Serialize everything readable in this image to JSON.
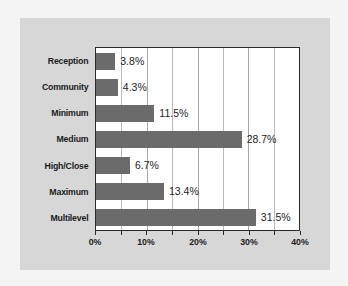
{
  "chart_data": {
    "type": "bar",
    "orientation": "horizontal",
    "title": "",
    "subtitle": "",
    "xlabel": "",
    "ylabel": "",
    "categories": [
      "Reception",
      "Community",
      "Minimum",
      "Medium",
      "High/Close",
      "Maximum",
      "Multilevel"
    ],
    "values": [
      3.8,
      4.3,
      11.5,
      28.7,
      6.7,
      13.4,
      31.5
    ],
    "value_labels": [
      "3.8%",
      "4.3%",
      "11.5%",
      "28.7%",
      "6.7%",
      "13.4%",
      "31.5%"
    ],
    "xlim": [
      0,
      40
    ],
    "xticks": [
      0,
      10,
      20,
      30,
      40
    ],
    "xtick_labels": [
      "0%",
      "10%",
      "20%",
      "30%",
      "40%"
    ],
    "minor_gridlines": [
      5,
      10,
      15,
      20,
      25,
      30,
      35
    ],
    "grid": true,
    "legend": null,
    "colors": {
      "bar": "#6b6b6b",
      "plot_background": "#ffffff",
      "panel_background": "#d7d7d7",
      "page_background": "#f4f4f4",
      "axis": "#2b2b2b",
      "gridline": "#b9b9b9",
      "text": "#1b1b1b"
    }
  }
}
